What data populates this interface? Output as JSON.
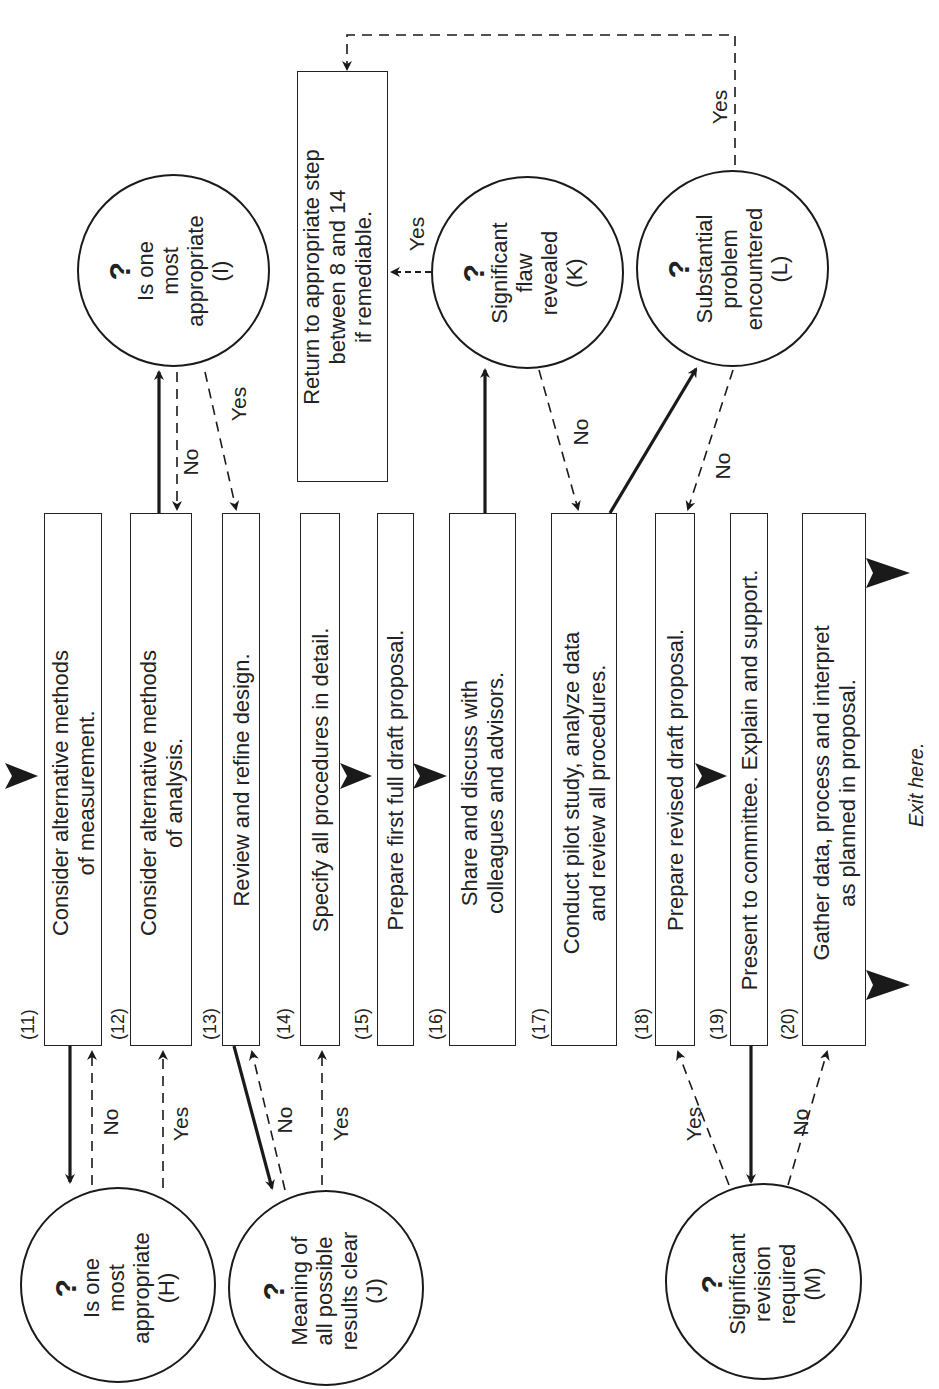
{
  "diagram": {
    "orientation": "rotated -90deg (text reads bottom-to-top)",
    "steps": [
      {
        "num": "(11)",
        "text_lines": [
          "Consider alternative methods",
          "of measurement."
        ]
      },
      {
        "num": "(12)",
        "text_lines": [
          "Consider alternative methods",
          "of analysis."
        ]
      },
      {
        "num": "(13)",
        "text_lines": [
          "Review and refine design."
        ]
      },
      {
        "num": "(14)",
        "text_lines": [
          "Specify all procedures in detail."
        ]
      },
      {
        "num": "(15)",
        "text_lines": [
          "Prepare first full draft proposal."
        ]
      },
      {
        "num": "(16)",
        "text_lines": [
          "Share and discuss with",
          "colleagues and advisors."
        ]
      },
      {
        "num": "(17)",
        "text_lines": [
          "Conduct pilot study, analyze data",
          "and review all procedures."
        ]
      },
      {
        "num": "(18)",
        "text_lines": [
          "Prepare revised draft proposal."
        ]
      },
      {
        "num": "(19)",
        "text_lines": [
          "Present to committee. Explain and support."
        ]
      },
      {
        "num": "(20)",
        "text_lines": [
          "Gather data, process and interpret",
          "as planned in proposal."
        ]
      }
    ],
    "return_box": {
      "text_lines": [
        "Return to appropriate step",
        "between 8 and 14",
        "if remediable."
      ]
    },
    "decisions": [
      {
        "id": "H",
        "symbol": "?",
        "text_lines": [
          "Is one",
          "most",
          "appropriate",
          "(H)"
        ]
      },
      {
        "id": "I",
        "symbol": "?",
        "text_lines": [
          "Is one",
          "most",
          "appropriate",
          "(I)"
        ]
      },
      {
        "id": "J",
        "symbol": "?",
        "text_lines": [
          "Meaning of",
          "all possible",
          "results clear",
          "(J)"
        ]
      },
      {
        "id": "K",
        "symbol": "?",
        "text_lines": [
          "Significant",
          "flaw",
          "revealed",
          "(K)"
        ]
      },
      {
        "id": "L",
        "symbol": "?",
        "text_lines": [
          "Substantial",
          "problem",
          "encountered",
          "(L)"
        ]
      },
      {
        "id": "M",
        "symbol": "?",
        "text_lines": [
          "Significant",
          "revision",
          "required",
          "(M)"
        ]
      }
    ],
    "edge_labels": {
      "h_no": "No",
      "h_yes": "Yes",
      "i_no": "No",
      "i_yes": "Yes",
      "j_no": "No",
      "j_yes": "Yes",
      "k_no": "No",
      "k_yes": "Yes",
      "l_no": "No",
      "l_yes": "Yes",
      "m_yes": "Yes",
      "m_no": "No"
    },
    "exit_label": "Exit here.",
    "colors": {
      "ink": "#1a1a1a",
      "background": "#ffffff"
    }
  }
}
